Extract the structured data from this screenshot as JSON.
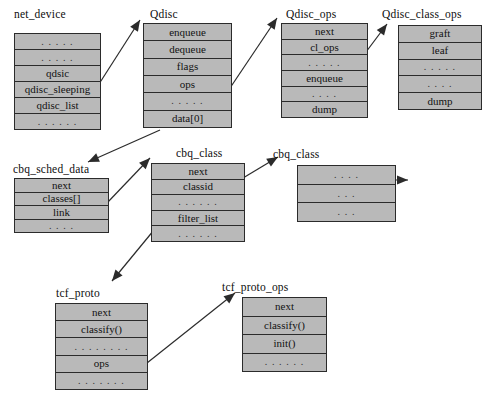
{
  "figure": {
    "caption": "",
    "colors": {
      "box_fill": "#b9b9b9",
      "box_border": "#2b2b2b",
      "arrow": "#2b2b2b",
      "text": "#121212",
      "background": "#ffffff"
    }
  },
  "structs": [
    {
      "id": "net_device",
      "name": "net_device",
      "title_x": 14,
      "title_y": 8,
      "box_x": 14,
      "box_y": 33,
      "box_w": 87,
      "box_h": 97,
      "rows": [
        {
          "label": ". . . . .",
          "ellipsis": true
        },
        {
          "label": ". . . . .",
          "ellipsis": true
        },
        {
          "label": "qdsic",
          "ellipsis": false
        },
        {
          "label": "qdisc_sleeping",
          "ellipsis": false
        },
        {
          "label": "qdisc_list",
          "ellipsis": false
        },
        {
          "label": ". . . . . .",
          "ellipsis": true
        }
      ]
    },
    {
      "id": "qdisc",
      "name": "Qdisc",
      "title_x": 150,
      "title_y": 8,
      "box_x": 143,
      "box_y": 23,
      "box_w": 89,
      "box_h": 105,
      "rows": [
        {
          "label": "enqueue",
          "ellipsis": false
        },
        {
          "label": "dequeue",
          "ellipsis": false
        },
        {
          "label": "flags",
          "ellipsis": false
        },
        {
          "label": "ops",
          "ellipsis": false
        },
        {
          "label": ". . . . .",
          "ellipsis": true
        },
        {
          "label": "data[0]",
          "ellipsis": false
        }
      ]
    },
    {
      "id": "qdisc_ops",
      "name": "Qdisc_ops",
      "title_x": 286,
      "title_y": 8,
      "box_x": 281,
      "box_y": 23,
      "box_w": 87,
      "box_h": 95,
      "rows": [
        {
          "label": "next",
          "ellipsis": false
        },
        {
          "label": "cl_ops",
          "ellipsis": false
        },
        {
          "label": ". . . . .",
          "ellipsis": true
        },
        {
          "label": "enqueue",
          "ellipsis": false
        },
        {
          "label": ". . . .",
          "ellipsis": true
        },
        {
          "label": "dump",
          "ellipsis": false
        }
      ]
    },
    {
      "id": "qdisc_class_ops",
      "name": "Qdisc_class_ops",
      "title_x": 382,
      "title_y": 8,
      "box_x": 398,
      "box_y": 25,
      "box_w": 84,
      "box_h": 85,
      "rows": [
        {
          "label": "graft",
          "ellipsis": false
        },
        {
          "label": "leaf",
          "ellipsis": false
        },
        {
          "label": ". . . . .",
          "ellipsis": true
        },
        {
          "label": ". . . .",
          "ellipsis": true
        },
        {
          "label": "dump",
          "ellipsis": false
        }
      ]
    },
    {
      "id": "cbq_sched_data",
      "name": "cbq_sched_data",
      "title_x": 13,
      "title_y": 163,
      "box_x": 14,
      "box_y": 178,
      "box_w": 95,
      "box_h": 55,
      "rows": [
        {
          "label": "next",
          "ellipsis": false
        },
        {
          "label": "classes[]",
          "ellipsis": false
        },
        {
          "label": "link",
          "ellipsis": false
        },
        {
          "label": ". . . .",
          "ellipsis": true
        }
      ]
    },
    {
      "id": "cbq_class_left",
      "name": "cbq_class",
      "title_x": 176,
      "title_y": 147,
      "box_x": 151,
      "box_y": 163,
      "box_w": 94,
      "box_h": 79,
      "rows": [
        {
          "label": "next",
          "ellipsis": false
        },
        {
          "label": "classid",
          "ellipsis": false
        },
        {
          "label": ". . . . . .",
          "ellipsis": true
        },
        {
          "label": "filter_list",
          "ellipsis": false
        },
        {
          "label": ". . . . . .",
          "ellipsis": true
        }
      ]
    },
    {
      "id": "cbq_class_right",
      "name": "cbq_class",
      "title_x": 273,
      "title_y": 148,
      "box_x": 297,
      "box_y": 165,
      "box_w": 99,
      "box_h": 57,
      "rows": [
        {
          "label": ". . . .",
          "ellipsis": true
        },
        {
          "label": ". . .",
          "ellipsis": true
        },
        {
          "label": ". . .",
          "ellipsis": true
        }
      ]
    },
    {
      "id": "tcf_proto",
      "name": "tcf_proto",
      "title_x": 56,
      "title_y": 287,
      "box_x": 55,
      "box_y": 303,
      "box_w": 93,
      "box_h": 87,
      "rows": [
        {
          "label": "next",
          "ellipsis": false
        },
        {
          "label": "classify()",
          "ellipsis": false
        },
        {
          "label": ". . . . . . . .",
          "ellipsis": true
        },
        {
          "label": "ops",
          "ellipsis": false
        },
        {
          "label": ". . . . . . .",
          "ellipsis": true
        }
      ]
    },
    {
      "id": "tcf_proto_ops",
      "name": "tcf_proto_ops",
      "title_x": 222,
      "title_y": 281,
      "box_x": 242,
      "box_y": 297,
      "box_w": 85,
      "box_h": 75,
      "rows": [
        {
          "label": "next",
          "ellipsis": false
        },
        {
          "label": "classify()",
          "ellipsis": false
        },
        {
          "label": "init()",
          "ellipsis": false
        },
        {
          "label": ". . . . . .",
          "ellipsis": true
        }
      ]
    }
  ],
  "arrows": [
    {
      "id": "netdev-qdisc",
      "from": "net_device.qdsic",
      "to": "qdisc.title",
      "x1": 99,
      "y1": 84,
      "x2": 140,
      "y2": 20
    },
    {
      "id": "qdisc-qdiscops",
      "from": "qdisc.ops",
      "to": "qdisc_ops.title",
      "x1": 230,
      "y1": 88,
      "x2": 277,
      "y2": 18
    },
    {
      "id": "qdiscops-classops",
      "from": "qdisc_ops.cl_ops",
      "to": "qdisc_class_ops.title",
      "x1": 366,
      "y1": 52,
      "x2": 387,
      "y2": 24
    },
    {
      "id": "data0-cbqsched",
      "from": "qdisc.data[0]",
      "to": "cbq_sched_data.title",
      "x1": 160,
      "y1": 130,
      "x2": 88,
      "y2": 162
    },
    {
      "id": "classes-cbqclass",
      "from": "cbq_sched_data.classes[]",
      "to": "cbq_class_left.title",
      "x1": 107,
      "y1": 203,
      "x2": 150,
      "y2": 158
    },
    {
      "id": "cbqclass-cbqclass",
      "from": "cbq_class_left.next",
      "to": "cbq_class_right.title",
      "x1": 243,
      "y1": 178,
      "x2": 278,
      "y2": 157
    },
    {
      "id": "cbqclass-right-out",
      "from": "cbq_class_right.row1",
      "to": "offscreen",
      "x1": 355,
      "y1": 180,
      "x2": 408,
      "y2": 180
    },
    {
      "id": "filterlist-tcfproto",
      "from": "cbq_class_left.filter_list",
      "to": "tcf_proto.title",
      "x1": 168,
      "y1": 213,
      "x2": 112,
      "y2": 281
    },
    {
      "id": "ops-tcfprotoops",
      "from": "tcf_proto.ops",
      "to": "tcf_proto_ops.title",
      "x1": 147,
      "y1": 363,
      "x2": 235,
      "y2": 293
    }
  ]
}
